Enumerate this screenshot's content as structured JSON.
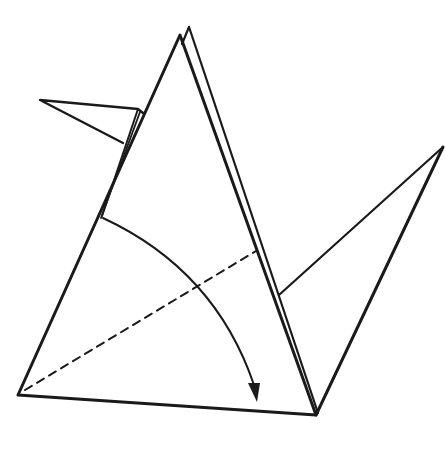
{
  "diagram": {
    "type": "origami-step",
    "colors": {
      "line": "#1a1a1a",
      "background": "#ffffff"
    },
    "elements": [
      {
        "name": "main-body-triangle",
        "kind": "solid-outline"
      },
      {
        "name": "back-layer-flap",
        "kind": "solid-outline"
      },
      {
        "name": "head-beak-flap",
        "kind": "solid-outline"
      },
      {
        "name": "tail-flap",
        "kind": "solid-outline"
      },
      {
        "name": "fold-line",
        "kind": "valley-fold-dashed"
      },
      {
        "name": "fold-direction-arrow",
        "kind": "curved-arrow"
      }
    ]
  }
}
